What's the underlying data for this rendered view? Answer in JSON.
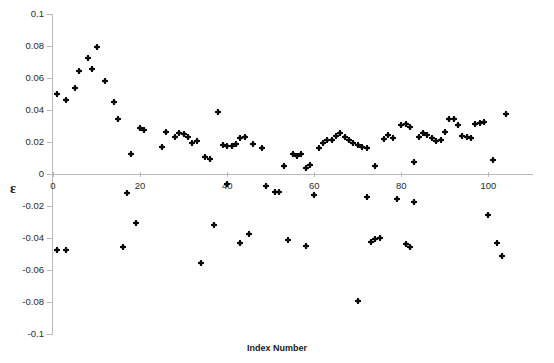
{
  "chart_data": {
    "type": "scatter",
    "title": "",
    "xlabel": "Index Number",
    "ylabel": "ε",
    "xlim": [
      0,
      110
    ],
    "ylim": [
      -0.1,
      0.1
    ],
    "x_ticks": [
      0,
      20,
      40,
      60,
      80,
      100
    ],
    "x_tick_labels": [
      "0",
      "20",
      "40",
      "60",
      "80",
      "100"
    ],
    "y_ticks": [
      0.1,
      0.08,
      0.06,
      0.04,
      0.02,
      0,
      -0.02,
      -0.04,
      -0.06,
      -0.08,
      -0.1
    ],
    "y_tick_labels": [
      "0.1",
      "0.08",
      "0.06",
      "0.04",
      "0.02",
      "0",
      "-0.02",
      "-0.04",
      "-0.06",
      "-0.08",
      "-0.1"
    ],
    "grid": false,
    "legend": false,
    "marker_color": "#0a0a0a",
    "axis_color": "#b9b9bd",
    "series": [
      {
        "name": "epsilon",
        "points": [
          [
            1,
            0.05
          ],
          [
            1,
            -0.0475
          ],
          [
            3,
            -0.0475
          ],
          [
            3,
            0.0465
          ],
          [
            5,
            0.0537
          ],
          [
            6,
            0.0643
          ],
          [
            8,
            0.0722
          ],
          [
            9,
            0.0654
          ],
          [
            10,
            0.0795
          ],
          [
            12,
            0.0583
          ],
          [
            14,
            0.0451
          ],
          [
            15,
            0.0345
          ],
          [
            16,
            -0.0458
          ],
          [
            17,
            -0.0118
          ],
          [
            18,
            0.0124
          ],
          [
            19,
            -0.0307
          ],
          [
            20,
            0.0285
          ],
          [
            21,
            0.0272
          ],
          [
            25,
            0.0168
          ],
          [
            26,
            0.0263
          ],
          [
            28,
            0.0232
          ],
          [
            29,
            0.0254
          ],
          [
            30,
            0.0252
          ],
          [
            31,
            0.0232
          ],
          [
            32,
            0.0196
          ],
          [
            33,
            0.0205
          ],
          [
            34,
            -0.0555
          ],
          [
            35,
            0.0104
          ],
          [
            36,
            0.0096
          ],
          [
            37,
            -0.0317
          ],
          [
            38,
            0.039
          ],
          [
            39,
            0.0183
          ],
          [
            40,
            0.0172
          ],
          [
            40,
            -0.0064
          ],
          [
            41,
            0.0173
          ],
          [
            42,
            0.0189
          ],
          [
            43,
            -0.0433
          ],
          [
            43,
            0.0228
          ],
          [
            44,
            0.0232
          ],
          [
            45,
            -0.0374
          ],
          [
            46,
            0.0189
          ],
          [
            48,
            0.0164
          ],
          [
            49,
            -0.0073
          ],
          [
            51,
            -0.011
          ],
          [
            52,
            -0.011
          ],
          [
            53,
            0.005
          ],
          [
            54,
            -0.041
          ],
          [
            55,
            0.0122
          ],
          [
            56,
            0.0111
          ],
          [
            57,
            0.0124
          ],
          [
            58,
            0.0036
          ],
          [
            58,
            -0.0449
          ],
          [
            59,
            0.0058
          ],
          [
            60,
            -0.0132
          ],
          [
            61,
            0.0163
          ],
          [
            62,
            0.0192
          ],
          [
            63,
            0.021
          ],
          [
            64,
            0.0215
          ],
          [
            65,
            0.0236
          ],
          [
            66,
            0.0258
          ],
          [
            67,
            0.0233
          ],
          [
            68,
            0.0212
          ],
          [
            69,
            0.0196
          ],
          [
            70,
            0.0184
          ],
          [
            70,
            -0.0796
          ],
          [
            71,
            0.017
          ],
          [
            72,
            -0.0142
          ],
          [
            72,
            0.0165
          ],
          [
            73,
            -0.0426
          ],
          [
            74,
            -0.0407
          ],
          [
            74,
            0.0047
          ],
          [
            75,
            -0.0398
          ],
          [
            76,
            0.0219
          ],
          [
            77,
            0.0241
          ],
          [
            78,
            0.0224
          ],
          [
            79,
            -0.0156
          ],
          [
            80,
            0.0304
          ],
          [
            81,
            0.0313
          ],
          [
            81,
            -0.0436
          ],
          [
            82,
            0.0294
          ],
          [
            82,
            -0.0458
          ],
          [
            83,
            0.0077
          ],
          [
            83,
            -0.0174
          ],
          [
            84,
            0.0232
          ],
          [
            85,
            0.0254
          ],
          [
            86,
            0.0244
          ],
          [
            87,
            0.0226
          ],
          [
            88,
            0.0207
          ],
          [
            89,
            0.0213
          ],
          [
            90,
            0.0263
          ],
          [
            91,
            0.0345
          ],
          [
            92,
            0.0341
          ],
          [
            93,
            0.0305
          ],
          [
            94,
            0.024
          ],
          [
            95,
            0.0231
          ],
          [
            96,
            0.0225
          ],
          [
            97,
            0.0315
          ],
          [
            98,
            0.0317
          ],
          [
            99,
            0.0325
          ],
          [
            100,
            -0.0258
          ],
          [
            101,
            0.0087
          ],
          [
            102,
            -0.0432
          ],
          [
            103,
            -0.0511
          ],
          [
            104,
            0.0376
          ]
        ]
      }
    ]
  }
}
